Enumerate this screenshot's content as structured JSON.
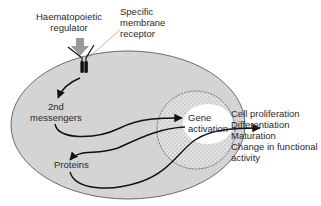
{
  "diagram": {
    "labels": {
      "regulator_line1": "Haematopoietic",
      "regulator_line2": "regulator",
      "receptor_line1": "Specific",
      "receptor_line2": "membrane",
      "receptor_line3": "receptor",
      "messengers_line1": "2nd",
      "messengers_line2": "messengers",
      "gene_line1": "Gene",
      "gene_line2": "activation",
      "proteins": "Proteins"
    },
    "outcomes": [
      "Cell proliferation",
      "Differentiation",
      "Maturation",
      "Change in functional",
      "activity"
    ],
    "colors": {
      "cell_fill": "#d4d4d4",
      "cell_stroke": "#6a6a6a",
      "nucleus_fill": "#bdbdbd",
      "gene_area": "#ffffff",
      "arrow": "#111111",
      "regulator_arrow": "#9a9a9a",
      "text": "#2a2a2a"
    }
  }
}
